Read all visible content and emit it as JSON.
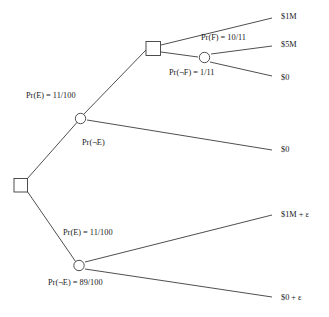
{
  "diagram": {
    "type": "decision-tree",
    "background_color": "#ffffff",
    "line_color": "#3b3b3b",
    "text_color": "#1a1a1a"
  },
  "nodes": {
    "root_decision": {
      "shape": "square",
      "label": ""
    },
    "upper_chance": {
      "shape": "circle",
      "label": ""
    },
    "upper_decision": {
      "shape": "square",
      "label": ""
    },
    "upper_inner_chance": {
      "shape": "circle",
      "label": ""
    },
    "lower_chance": {
      "shape": "circle",
      "label": ""
    }
  },
  "edge_labels": {
    "upper_prob_e": "Pr(E) = 11/100",
    "upper_prob_not_e": "Pr(¬E)",
    "prob_f": "Pr(F) = 10/11",
    "prob_not_f": "Pr(¬F) = 1/11",
    "lower_prob_e": "Pr(E) = 11/100",
    "lower_prob_not_e": "Pr(¬E) = 89/100"
  },
  "payoffs": {
    "top": "$1M",
    "second": "$5M",
    "third": "$0",
    "fourth": "$0",
    "fifth": "$1M + ε",
    "sixth": "$0 + ε"
  }
}
